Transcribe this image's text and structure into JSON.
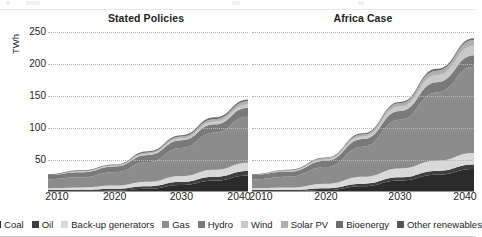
{
  "chart_data": {
    "type": "area",
    "title": "",
    "ylabel": "TWh",
    "xlabel": "",
    "ylim": [
      0,
      260
    ],
    "yticks": [
      50,
      100,
      150,
      200,
      250
    ],
    "xticks": [
      2010,
      2020,
      2030,
      2040
    ],
    "xlim": [
      2010,
      2040
    ],
    "grid": true,
    "stacked": true,
    "legend_position": "bottom",
    "legend": [
      {
        "name": "Coal",
        "color": "#2b2b2b"
      },
      {
        "name": "Oil",
        "color": "#3f3f3f"
      },
      {
        "name": "Back-up generators",
        "color": "#d9d9d9"
      },
      {
        "name": "Gas",
        "color": "#8c8c8c"
      },
      {
        "name": "Hydro",
        "color": "#7a7a7a"
      },
      {
        "name": "Wind",
        "color": "#c9c9c9"
      },
      {
        "name": "Solar PV",
        "color": "#b0b0b0"
      },
      {
        "name": "Bioenergy",
        "color": "#6e6e6e"
      },
      {
        "name": "Other renewables",
        "color": "#555555"
      }
    ],
    "panels": [
      {
        "title": "Stated Policies",
        "x": [
          2010,
          2015,
          2020,
          2025,
          2030,
          2035,
          2040
        ],
        "series": [
          {
            "name": "Coal",
            "color": "#2b2b2b",
            "values": [
              1,
              1,
              2,
              5,
              11,
              18,
              26
            ]
          },
          {
            "name": "Oil",
            "color": "#3f3f3f",
            "values": [
              2,
              2,
              3,
              4,
              5,
              6,
              7
            ]
          },
          {
            "name": "Back-up generators",
            "color": "#d9d9d9",
            "values": [
              3,
              4,
              5,
              7,
              9,
              11,
              13
            ]
          },
          {
            "name": "Gas",
            "color": "#8c8c8c",
            "values": [
              14,
              16,
              21,
              31,
              44,
              58,
              72
            ]
          },
          {
            "name": "Hydro",
            "color": "#7a7a7a",
            "values": [
              7,
              8,
              9,
              11,
              12,
              13,
              14
            ]
          },
          {
            "name": "Wind",
            "color": "#c9c9c9",
            "values": [
              0,
              1,
              1,
              2,
              3,
              4,
              5
            ]
          },
          {
            "name": "Solar PV",
            "color": "#b0b0b0",
            "values": [
              0,
              1,
              1,
              2,
              3,
              4,
              5
            ]
          },
          {
            "name": "Bioenergy",
            "color": "#6e6e6e",
            "values": [
              1,
              1,
              1,
              2,
              2,
              3,
              3
            ]
          },
          {
            "name": "Other renewables",
            "color": "#555555",
            "values": [
              0,
              0,
              0,
              0,
              0,
              0,
              0
            ]
          }
        ],
        "total": [
          28,
          34,
          43,
          64,
          89,
          117,
          145
        ]
      },
      {
        "title": "Africa Case",
        "x": [
          2010,
          2015,
          2020,
          2025,
          2030,
          2035,
          2040
        ],
        "series": [
          {
            "name": "Coal",
            "color": "#2b2b2b",
            "values": [
              1,
              1,
              3,
              9,
              18,
              27,
              36
            ]
          },
          {
            "name": "Oil",
            "color": "#3f3f3f",
            "values": [
              2,
              2,
              3,
              4,
              5,
              6,
              7
            ]
          },
          {
            "name": "Back-up generators",
            "color": "#d9d9d9",
            "values": [
              3,
              4,
              7,
              11,
              14,
              16,
              18
            ]
          },
          {
            "name": "Gas",
            "color": "#8c8c8c",
            "values": [
              14,
              17,
              26,
              47,
              76,
              107,
              135
            ]
          },
          {
            "name": "Hydro",
            "color": "#7a7a7a",
            "values": [
              7,
              8,
              10,
              12,
              14,
              16,
              18
            ]
          },
          {
            "name": "Wind",
            "color": "#c9c9c9",
            "values": [
              0,
              1,
              2,
              4,
              7,
              11,
              15
            ]
          },
          {
            "name": "Solar PV",
            "color": "#b0b0b0",
            "values": [
              0,
              1,
              2,
              3,
              5,
              7,
              9
            ]
          },
          {
            "name": "Bioenergy",
            "color": "#6e6e6e",
            "values": [
              1,
              1,
              1,
              2,
              2,
              3,
              3
            ]
          },
          {
            "name": "Other renewables",
            "color": "#555555",
            "values": [
              0,
              0,
              0,
              0,
              0,
              0,
              0
            ]
          }
        ],
        "total": [
          28,
          35,
          54,
          92,
          141,
          193,
          241
        ]
      }
    ]
  }
}
